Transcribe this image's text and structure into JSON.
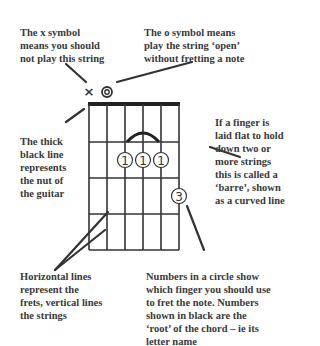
{
  "annotations": {
    "x_symbol": [
      "The x symbol",
      "means you should",
      "not play this string"
    ],
    "o_symbol": [
      "The o symbol means",
      "play the string ‘open’",
      "without fretting a note"
    ],
    "nut": [
      "The thick",
      "black line",
      "represents",
      "the nut of",
      "the guitar"
    ],
    "barre": [
      "If a finger is",
      "laid flat to hold",
      "down two or",
      "more strings",
      "this is called a",
      "‘barre’, shown",
      "as a curved line"
    ],
    "frets": [
      "Horizontal lines",
      "represent the",
      "frets, vertical lines",
      "the strings"
    ],
    "numbers": [
      "Numbers in a circle show",
      "which finger you should use",
      "to fret the note. Numbers",
      "shown in black are the",
      "‘root’ of the chord – ie its",
      "letter name"
    ]
  },
  "chord": {
    "symbols": {
      "muted": "×",
      "open": "◎"
    },
    "fingers": [
      {
        "label": "1",
        "string": 2,
        "fret": 2
      },
      {
        "label": "1",
        "string": 3,
        "fret": 2
      },
      {
        "label": "1",
        "string": 4,
        "fret": 2
      },
      {
        "label": "3",
        "string": 5,
        "fret": 3
      }
    ],
    "strings": 6,
    "frets": 4
  },
  "colors": {
    "ink": "#3a3a3a",
    "grid": "#333333",
    "nut": "#222222"
  }
}
